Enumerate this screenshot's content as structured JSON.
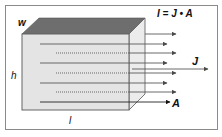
{
  "diagram": {
    "title_formula": "I = J • A",
    "labels": {
      "width": "w",
      "height": "h",
      "length": "l",
      "current_density": "J",
      "area": "A"
    },
    "colors": {
      "top_face": "#6e6e6e",
      "front_face": "#e4e4e4",
      "side_face": "#ececec",
      "lines": "#5a5a5a",
      "frame_border": "#8a8a8a"
    },
    "elements": {
      "conductor_block": "Rectangular conductor block with cross-section area A",
      "flow_lines": 7,
      "arrow_heads": 7
    }
  }
}
